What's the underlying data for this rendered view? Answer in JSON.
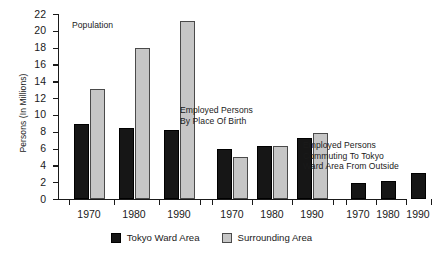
{
  "chart_data": {
    "type": "bar",
    "title": "",
    "xlabel": "",
    "ylabel": "Persons (In Millions)",
    "ylim": [
      0,
      22
    ],
    "ytick_step": 2,
    "yticks": [
      0,
      2,
      4,
      6,
      8,
      10,
      12,
      14,
      16,
      18,
      20,
      22
    ],
    "grid": false,
    "legend_position": "bottom-center",
    "orientation": "vertical",
    "series": [
      {
        "name": "Tokyo Ward Area",
        "color": "#161616"
      },
      {
        "name": "Surrounding Area",
        "color": "#c6c6c6"
      }
    ],
    "groups": [
      {
        "label": "Population",
        "categories": [
          "1970",
          "1980",
          "1990"
        ],
        "series": [
          {
            "name": "Tokyo Ward Area",
            "values": [
              8.9,
              8.4,
              8.2
            ]
          },
          {
            "name": "Surrounding Area",
            "values": [
              13.1,
              18.0,
              21.2
            ]
          }
        ]
      },
      {
        "label": "Employed Persons\nBy Place Of Birth",
        "categories": [
          "1970",
          "1980",
          "1990"
        ],
        "series": [
          {
            "name": "Tokyo Ward Area",
            "values": [
              6.0,
              6.3,
              7.3
            ]
          },
          {
            "name": "Surrounding Area",
            "values": [
              5.0,
              6.3,
              7.8
            ]
          }
        ]
      },
      {
        "label": "Employed Persons\nCommuting To Tokyo\nWard Area From Outside",
        "categories": [
          "1970",
          "1980",
          "1990"
        ],
        "series": [
          {
            "name": "Tokyo Ward Area",
            "values": [
              1.9,
              2.2,
              3.1
            ]
          },
          {
            "name": "Surrounding Area",
            "values": [
              null,
              null,
              null
            ]
          }
        ]
      }
    ]
  },
  "legend": {
    "items": [
      {
        "label": "Tokyo Ward Area",
        "color": "#161616"
      },
      {
        "label": "Surrounding Area",
        "color": "#c6c6c6"
      }
    ]
  },
  "annotations": [
    {
      "id": "population",
      "text": "Population"
    },
    {
      "id": "by-birth",
      "text": "Employed Persons\nBy Place Of Birth"
    },
    {
      "id": "commuting",
      "text": "Employed Persons\nCommuting To Tokyo\nWard Area From Outside"
    }
  ],
  "layout": {
    "group_x_centers": [
      [
        31,
        76,
        121
      ],
      [
        174,
        214,
        254
      ],
      [
        300,
        330,
        360
      ]
    ],
    "annotation_positions": [
      {
        "left": 72,
        "top": 20
      },
      {
        "left": 180,
        "top": 105
      },
      {
        "left": 303,
        "top": 140
      }
    ],
    "group_separator_ticks": [
      0,
      154,
      282,
      348
    ],
    "bar_width": 15,
    "bar_gap": 1
  }
}
